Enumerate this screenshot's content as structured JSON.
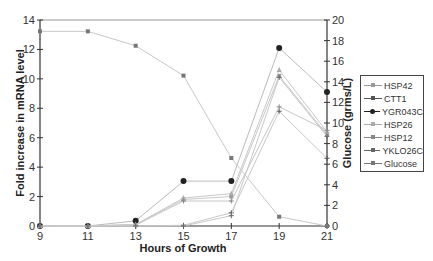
{
  "chart_data": {
    "type": "line",
    "title": "",
    "xlabel": "Hours of Growth",
    "ylabel": "Fold increase in mRNA level",
    "y2label": "Glucose (grms/L)",
    "x": [
      9,
      11,
      13,
      15,
      17,
      19,
      21
    ],
    "xticks": [
      "9",
      "11",
      "13",
      "15",
      "17",
      "19",
      "21"
    ],
    "ylim": [
      0,
      14
    ],
    "yticks": [
      "0",
      "2",
      "4",
      "6",
      "8",
      "10",
      "12",
      "14"
    ],
    "y2lim": [
      0,
      20
    ],
    "y2ticks": [
      "0",
      "2",
      "4",
      "6",
      "8",
      "10",
      "12",
      "14",
      "16",
      "18",
      "20"
    ],
    "grid": false,
    "legend_position": "right",
    "series": [
      {
        "name": "HSP42",
        "axis": "left",
        "marker": "square",
        "color": "#9a9a9a",
        "values": [
          0,
          0,
          0.1,
          1.8,
          2.0,
          10.2,
          6.2
        ]
      },
      {
        "name": "CTT1",
        "axis": "left",
        "marker": "plus",
        "color": "#555555",
        "values": [
          0,
          0,
          0,
          0.05,
          0.9,
          7.8,
          4.6
        ]
      },
      {
        "name": "YGR043C",
        "axis": "left",
        "marker": "circle",
        "color": "#222222",
        "values": [
          0,
          0,
          0.35,
          3.05,
          3.05,
          12.1,
          9.1
        ]
      },
      {
        "name": "HSP26",
        "axis": "left",
        "marker": "triangle",
        "color": "#aaaaaa",
        "values": [
          0,
          0,
          0.1,
          1.9,
          2.2,
          10.6,
          6.4
        ]
      },
      {
        "name": "HSP12",
        "axis": "left",
        "marker": "plus",
        "color": "#888888",
        "values": [
          0,
          0,
          0.05,
          1.7,
          1.7,
          8.1,
          6.5
        ]
      },
      {
        "name": "YKLO26C",
        "axis": "left",
        "marker": "plus",
        "color": "#666666",
        "values": [
          0,
          0,
          0,
          0,
          0.7,
          10.1,
          6.1
        ]
      },
      {
        "name": "Glucose",
        "axis": "right",
        "marker": "square",
        "color": "#777777",
        "values": [
          18.9,
          18.9,
          17.5,
          14.6,
          6.6,
          0.9,
          0
        ]
      }
    ]
  },
  "legend": {
    "items": [
      "HSP42",
      "CTT1",
      "YGR043C",
      "HSP26",
      "HSP12",
      "YKLO26C",
      "Glucose"
    ]
  }
}
